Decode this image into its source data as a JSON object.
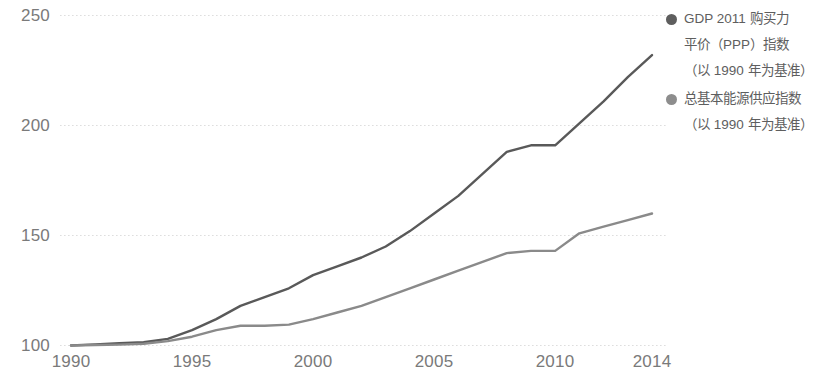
{
  "chart_data": {
    "type": "line",
    "title": "",
    "xlabel": "",
    "ylabel": "",
    "x": [
      1990,
      1991,
      1992,
      1993,
      1994,
      1995,
      1996,
      1997,
      1998,
      1999,
      2000,
      2001,
      2002,
      2003,
      2004,
      2005,
      2006,
      2007,
      2008,
      2009,
      2010,
      2011,
      2012,
      2013,
      2014
    ],
    "xlim": [
      1990,
      2014
    ],
    "ylim": [
      100,
      250
    ],
    "x_ticks": [
      1990,
      1995,
      2000,
      2005,
      2010,
      2014
    ],
    "x_tick_labels": [
      "1990",
      "1995",
      "2000",
      "2005",
      "2010",
      "2014"
    ],
    "y_ticks": [
      100,
      150,
      200,
      250
    ],
    "y_tick_labels": [
      "100",
      "150",
      "200",
      "250"
    ],
    "grid": "horizontal-dotted",
    "legend_position": "right",
    "series": [
      {
        "name": "GDP 2011 购买力平价（PPP）指数（以 1990 年为基准）",
        "color": "#595959",
        "values": [
          100,
          100.5,
          101,
          101.5,
          103,
          107,
          112,
          118,
          122,
          126,
          132,
          136,
          140,
          145,
          152,
          160,
          168,
          178,
          188,
          191,
          191,
          201,
          211,
          222,
          232
        ]
      },
      {
        "name": "总基本能源供应指数（以 1990 年为基准）",
        "color": "#8a8a8a",
        "values": [
          100,
          100.2,
          100.4,
          100.8,
          102,
          104,
          107,
          109,
          109,
          109.5,
          112,
          115,
          118,
          122,
          126,
          130,
          134,
          138,
          142,
          143,
          143,
          151,
          154,
          157,
          160
        ]
      }
    ]
  },
  "axis": {
    "y_labels": [
      "250",
      "200",
      "150",
      "100"
    ],
    "x_labels": [
      "1990",
      "1995",
      "2000",
      "2005",
      "2010",
      "2014"
    ]
  },
  "legend": {
    "entries": [
      {
        "marker_color": "#5e5e5e",
        "line1": "GDP 2011 购买力",
        "line2": "平价（PPP）指数",
        "line3": "（以 1990 年为基准）"
      },
      {
        "marker_color": "#8d8d8d",
        "line1": "总基本能源供应指数",
        "line2": "（以 1990 年为基准）",
        "line3": ""
      }
    ]
  },
  "colors": {
    "gdp_line": "#595959",
    "energy_line": "#8a8a8a",
    "gridline": "#dedede",
    "text": "#7a7a7a"
  }
}
